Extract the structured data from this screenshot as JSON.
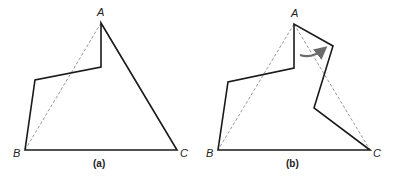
{
  "panels": [
    {
      "caption": "(a)",
      "vertices": {
        "A": "A",
        "B": "B",
        "C": "C"
      },
      "polygon": [
        [
          101,
          23
        ],
        [
          101,
          67
        ],
        [
          35,
          80
        ],
        [
          25,
          150
        ],
        [
          177,
          150
        ]
      ],
      "dashed": [
        [
          [
            101,
            23
          ],
          [
            25,
            150
          ]
        ]
      ]
    },
    {
      "caption": "(b)",
      "vertices": {
        "A": "A",
        "B": "B",
        "C": "C"
      },
      "polygon": [
        [
          294,
          24
        ],
        [
          294,
          68
        ],
        [
          228,
          82
        ],
        [
          218,
          150
        ],
        [
          370,
          150
        ],
        [
          314,
          108
        ],
        [
          333,
          46
        ]
      ],
      "dashed": [
        [
          [
            294,
            24
          ],
          [
            218,
            150
          ]
        ],
        [
          [
            294,
            24
          ],
          [
            370,
            150
          ]
        ]
      ],
      "arrow": "curved-arrow"
    }
  ],
  "colors": {
    "line": "#1a1a1a",
    "dashed": "#9a9a9a",
    "arrow": "#6b6b6b"
  }
}
